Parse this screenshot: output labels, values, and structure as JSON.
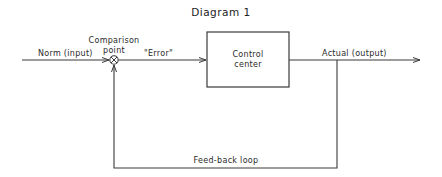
{
  "title": "Diagram 1",
  "nodes": {
    "input": {
      "label": "Norm (input)"
    },
    "comparison_point": {
      "label_line1": "Comparison",
      "label_line2": "point"
    },
    "error": {
      "label": "\"Error\""
    },
    "control_center": {
      "label_line1": "Control",
      "label_line2": "center"
    },
    "output": {
      "label": "Actual (output)"
    },
    "feedback": {
      "label": "Feed-back loop"
    }
  },
  "colors": {
    "line": "#3a3a3a",
    "text": "#222222",
    "background": "#ffffff"
  }
}
